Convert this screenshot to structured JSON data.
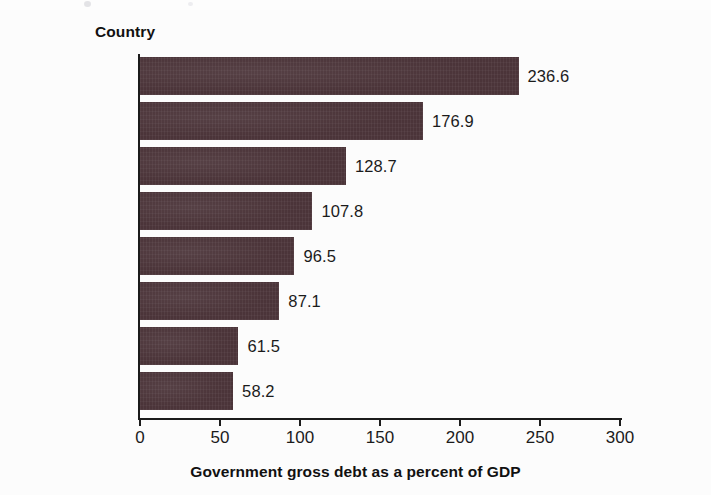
{
  "chart_data": {
    "type": "bar",
    "orientation": "horizontal",
    "title": "",
    "xlabel": "Government gross debt as a percent of GDP",
    "ylabel": "Country",
    "categories": [
      "Japan",
      "Greece",
      "Italy",
      "United States",
      "France",
      "Egypt",
      "Israel",
      "Argentina"
    ],
    "values": [
      236.6,
      176.9,
      128.7,
      107.8,
      96.5,
      87.1,
      61.5,
      58.2
    ],
    "value_labels": [
      "236.6",
      "176.9",
      "128.7",
      "107.8",
      "96.5",
      "87.1",
      "61.5",
      "58.2"
    ],
    "xlim": [
      0,
      300
    ],
    "xticks": [
      0,
      50,
      100,
      150,
      200,
      250,
      300
    ],
    "xtick_labels": [
      "0",
      "50",
      "100",
      "150",
      "200",
      "250",
      "300"
    ],
    "grid": false,
    "legend": false,
    "bar_color": "#4b3439",
    "background_color": "#fcfcfc",
    "text_color": "#1b1b1b"
  },
  "axes": {
    "y_axis_title": "Country",
    "x_axis_title": "Government gross debt as a percent of GDP"
  }
}
